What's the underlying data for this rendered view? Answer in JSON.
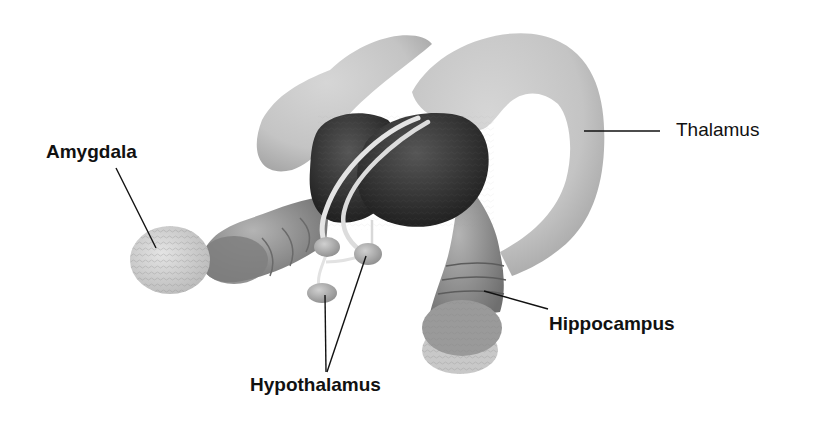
{
  "diagram": {
    "labels": {
      "amygdala": "Amygdala",
      "thalamus": "Thalamus",
      "hippocampus": "Hippocampus",
      "hypothalamus": "Hypothalamus"
    },
    "colors": {
      "background": "#ffffff",
      "thalamus_fill": "#c9c9c9",
      "thalamus_shadow": "#a9a9a9",
      "dark_mass": "#2e2e2e",
      "dark_mass_highlight": "#4a4a4a",
      "tube_fill": "#9d9d9d",
      "tube_dark": "#777777",
      "amygdala_fill": "#d9d9d9",
      "fornix": "#e6e6e6",
      "leader_line": "#111111"
    }
  }
}
